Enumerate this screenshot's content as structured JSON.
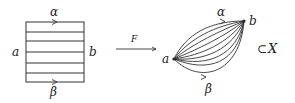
{
  "diagram": {
    "type": "homotopy-map",
    "square": {
      "top_label": "α",
      "bottom_label": "β",
      "left_label": "a",
      "right_label": "b",
      "num_horizontal_lines": 7
    },
    "map": {
      "arrow_label": "F"
    },
    "image": {
      "start_point_label": "a",
      "end_point_label": "b",
      "top_path_label": "α",
      "bottom_path_label": "β",
      "num_paths": 9,
      "subset_symbol": "⊂",
      "space_label": "X"
    },
    "colors": {
      "stroke": "#333333",
      "text": "#222222",
      "background": "#ffffff"
    }
  }
}
